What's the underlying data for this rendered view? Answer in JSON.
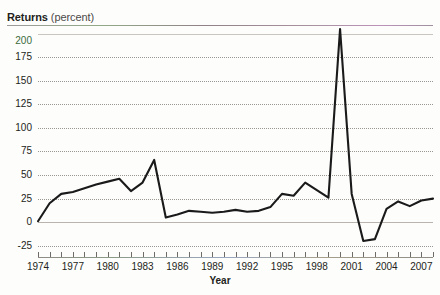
{
  "title": {
    "strong": "Returns",
    "light": "(percent)"
  },
  "axis_title_x": "Year",
  "chart_data": {
    "type": "line",
    "title": "Returns (percent)",
    "xlabel": "Year",
    "ylabel": "Returns (percent)",
    "xlim": [
      1974,
      2008
    ],
    "ylim": [
      -37,
      205
    ],
    "grid": true,
    "legend": "none",
    "ytick_labels": [
      "200",
      "175",
      "150",
      "125",
      "100",
      "75",
      "50",
      "25",
      "0",
      "-25"
    ],
    "yticks": [
      200,
      175,
      150,
      125,
      100,
      75,
      50,
      25,
      0,
      -25
    ],
    "xtick_labels": [
      "1974",
      "1977",
      "1980",
      "1983",
      "1986",
      "1989",
      "1992",
      "1995",
      "1998",
      "2001",
      "2004",
      "2007"
    ],
    "xticks_major": [
      1974,
      1977,
      1980,
      1983,
      1986,
      1989,
      1992,
      1995,
      1998,
      2001,
      2004,
      2007
    ],
    "xticks_minor": [
      1974,
      1975,
      1976,
      1977,
      1978,
      1979,
      1980,
      1981,
      1982,
      1983,
      1984,
      1985,
      1986,
      1987,
      1988,
      1989,
      1990,
      1991,
      1992,
      1993,
      1994,
      1995,
      1996,
      1997,
      1998,
      1999,
      2000,
      2001,
      2002,
      2003,
      2004,
      2005,
      2006,
      2007,
      2008
    ],
    "line_color": "#1a1a1a",
    "line_width": 2.1,
    "series": [
      {
        "name": "Returns",
        "x": [
          1974,
          1975,
          1976,
          1977,
          1978,
          1979,
          1980,
          1981,
          1982,
          1983,
          1984,
          1985,
          1986,
          1987,
          1988,
          1989,
          1990,
          1991,
          1992,
          1993,
          1994,
          1995,
          1996,
          1997,
          1998,
          1999,
          2000,
          2001,
          2002,
          2003,
          2004,
          2005,
          2006,
          2007,
          2008
        ],
        "values": [
          1,
          20,
          30,
          32,
          36,
          40,
          43,
          46,
          33,
          42,
          66,
          5,
          8,
          12,
          11,
          10,
          11,
          13,
          11,
          12,
          16,
          30,
          28,
          42,
          34,
          26,
          205,
          30,
          -20,
          -18,
          14,
          22,
          17,
          23,
          25
        ]
      }
    ]
  }
}
